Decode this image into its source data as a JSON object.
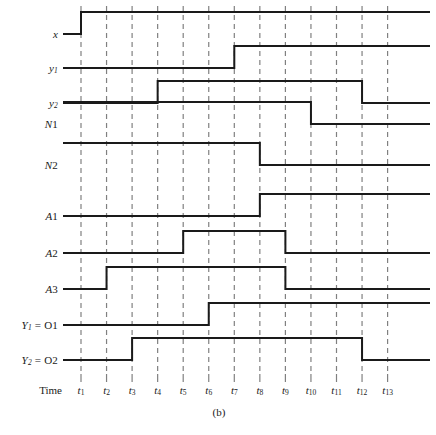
{
  "figure": {
    "caption": "(b)",
    "time_axis_label": "Time",
    "kind": "timing-diagram"
  },
  "chart_data": {
    "type": "line",
    "title": "",
    "subtitle": "",
    "xlabel": "Time",
    "ylabel": "",
    "grid": "vertical-dashed-at-time-markers",
    "legend": "none",
    "x": [
      "t1",
      "t2",
      "t3",
      "t4",
      "t5",
      "t6",
      "t7",
      "t8",
      "t9",
      "t10",
      "t11",
      "t12",
      "t13"
    ],
    "tick_labels": [
      {
        "name": "t1",
        "sub": "1"
      },
      {
        "name": "t2",
        "sub": "2"
      },
      {
        "name": "t3",
        "sub": "3"
      },
      {
        "name": "t4",
        "sub": "4"
      },
      {
        "name": "t5",
        "sub": "5"
      },
      {
        "name": "t6",
        "sub": "6"
      },
      {
        "name": "t7",
        "sub": "7"
      },
      {
        "name": "t8",
        "sub": "8"
      },
      {
        "name": "t9",
        "sub": "9"
      },
      {
        "name": "t10",
        "sub": "10"
      },
      {
        "name": "t11",
        "sub": "11"
      },
      {
        "name": "t12",
        "sub": "12"
      },
      {
        "name": "t13",
        "sub": "13"
      }
    ],
    "xlim": [
      0,
      14
    ],
    "ylim": [
      0,
      1
    ],
    "series": [
      {
        "name": "x",
        "label_main": "x",
        "label_sub": "",
        "label_suffix": "",
        "initial": 0,
        "transitions": [
          {
            "t": 1,
            "to": 1
          }
        ]
      },
      {
        "name": "y1",
        "label_main": "y",
        "label_sub": "1",
        "label_suffix": "",
        "initial": 0,
        "transitions": [
          {
            "t": 7,
            "to": 1
          }
        ]
      },
      {
        "name": "y2",
        "label_main": "y",
        "label_sub": "2",
        "label_suffix": "",
        "initial": 0,
        "transitions": [
          {
            "t": 4,
            "to": 1
          },
          {
            "t": 12,
            "to": 0
          }
        ]
      },
      {
        "name": "N1",
        "label_main": "N",
        "label_sub": "",
        "label_suffix": "1",
        "initial": 1,
        "transitions": [
          {
            "t": 10,
            "to": 0
          }
        ]
      },
      {
        "name": "N2",
        "label_main": "N",
        "label_sub": "",
        "label_suffix": "2",
        "initial": 1,
        "transitions": [
          {
            "t": 8,
            "to": 0
          }
        ]
      },
      {
        "name": "A1",
        "label_main": "A",
        "label_sub": "",
        "label_suffix": "1",
        "initial": 0,
        "transitions": [
          {
            "t": 8,
            "to": 1
          }
        ]
      },
      {
        "name": "A2",
        "label_main": "A",
        "label_sub": "",
        "label_suffix": "2",
        "initial": 0,
        "transitions": [
          {
            "t": 5,
            "to": 1
          },
          {
            "t": 9,
            "to": 0
          }
        ]
      },
      {
        "name": "A3",
        "label_main": "A",
        "label_sub": "",
        "label_suffix": "3",
        "initial": 0,
        "transitions": [
          {
            "t": 2,
            "to": 1
          },
          {
            "t": 9,
            "to": 0
          }
        ]
      },
      {
        "name": "Y1 = O1",
        "label_main": "Y",
        "label_sub": "1",
        "label_suffix": " = O1",
        "initial": 0,
        "transitions": [
          {
            "t": 6,
            "to": 1
          }
        ]
      },
      {
        "name": "Y2 = O2",
        "label_main": "Y",
        "label_sub": "2",
        "label_suffix": " = O2",
        "initial": 0,
        "transitions": [
          {
            "t": 3,
            "to": 1
          },
          {
            "t": 12,
            "to": 0
          }
        ]
      }
    ]
  },
  "style": {
    "signal_color": "#1a1a1a",
    "grid_color": "#808080",
    "background": "#ffffff"
  }
}
